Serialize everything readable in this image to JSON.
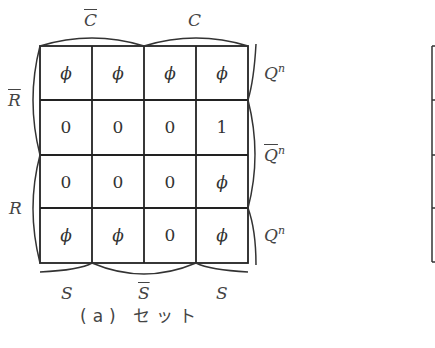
{
  "kmap": {
    "col_labels_top": [
      "C̄",
      "C"
    ],
    "col_labels_top_overline": [
      true,
      false
    ],
    "col_labels_bottom": [
      "S",
      "S̄",
      "S"
    ],
    "row_labels_left": [
      "R̄",
      "R"
    ],
    "row_labels_right": [
      {
        "base": "Q",
        "sup": "n",
        "overline": false
      },
      {
        "base": "Q",
        "sup": "n",
        "overline": true
      },
      {
        "base": "Q",
        "sup": "n",
        "overline": false
      }
    ],
    "cells": [
      [
        "ϕ",
        "ϕ",
        "ϕ",
        "ϕ"
      ],
      [
        "0",
        "0",
        "0",
        "1"
      ],
      [
        "0",
        "0",
        "0",
        "ϕ"
      ],
      [
        "ϕ",
        "ϕ",
        "0",
        "ϕ"
      ]
    ]
  },
  "labels": {
    "c_bar": "C",
    "c": "C",
    "r_bar": "R",
    "r": "R",
    "s_left": "S",
    "s_bar": "S",
    "s_right": "S",
    "q_top": "Q",
    "q_mid": "Q",
    "q_bot": "Q",
    "q_sup": "n"
  },
  "caption": "(a) セット"
}
